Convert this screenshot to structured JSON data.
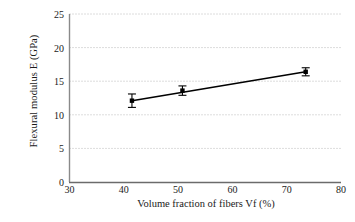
{
  "chart_data": {
    "type": "scatter",
    "title": "",
    "xlabel": "Volume fraction of fibers Vf (%)",
    "ylabel": "Flexural modulus E (GPa)",
    "xlim": [
      30,
      80
    ],
    "ylim": [
      0,
      25
    ],
    "xticks": [
      30,
      40,
      50,
      60,
      70,
      80
    ],
    "yticks": [
      0,
      5,
      10,
      15,
      20,
      25
    ],
    "xtick_labels": [
      "30",
      "40",
      "50",
      "60",
      "70",
      "80"
    ],
    "ytick_labels": [
      "0",
      "5",
      "10",
      "15",
      "20",
      "25"
    ],
    "grid": "horizontal-dotted",
    "legend": "none",
    "marker": "square",
    "marker_color": "#000000",
    "line_color": "#000000",
    "errorbar_color": "#000000",
    "series": [
      {
        "name": "Flexural modulus vs fiber volume fraction",
        "x": [
          41.5,
          50.8,
          73.5
        ],
        "y": [
          12.1,
          13.6,
          16.4
        ],
        "yerr": [
          1.0,
          0.7,
          0.6
        ]
      }
    ],
    "trendline": {
      "x": [
        41.5,
        73.5
      ],
      "y": [
        12.1,
        16.4
      ]
    }
  }
}
